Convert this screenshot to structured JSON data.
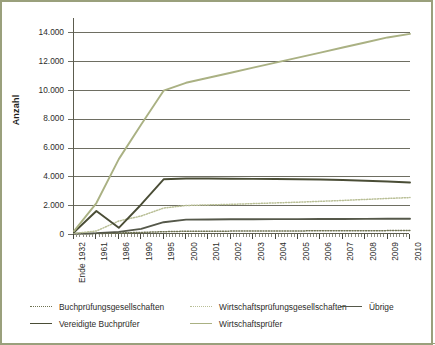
{
  "figure": {
    "border_color": "#9aa07c",
    "background": "#ffffff"
  },
  "axes": {
    "y_title": "Anzahl",
    "y_ticks": [
      "0",
      "2.000",
      "4.000",
      "6.000",
      "8.000",
      "10.000",
      "12.000",
      "14.000"
    ],
    "x_ticks": [
      "Ende 1932",
      "1961",
      "1986",
      "1990",
      "1995",
      "2000",
      "2001",
      "2002",
      "2003",
      "2004",
      "2005",
      "2006",
      "2007",
      "2008",
      "2009",
      "2010"
    ]
  },
  "legend": {
    "row1": [
      {
        "label": "Buchprüfungsgesellschaften",
        "style": "dotted",
        "color": "#6f7352",
        "name": "legend-buchpruefungsgesellschaften"
      },
      {
        "label": "Wirtschaftsprüfungsgesellschaften",
        "style": "dotted",
        "color": "#b9bf96",
        "name": "legend-wirtschaftspruefungsgesellschaften"
      },
      {
        "label": "Übrige",
        "style": "solid",
        "color": "#55584a",
        "name": "legend-uebrige"
      }
    ],
    "row2": [
      {
        "label": "Vereidigte Buchprüfer",
        "style": "solid",
        "color": "#4a4d36",
        "name": "legend-vereidigte-buchpruefer"
      },
      {
        "label": "Wirtschaftsprüfer",
        "style": "solid",
        "color": "#aab183",
        "name": "legend-wirtschaftspruefer"
      }
    ]
  },
  "chart_data": {
    "type": "line",
    "title": "",
    "xlabel": "",
    "ylabel": "Anzahl",
    "ylim": [
      0,
      15000
    ],
    "grid": true,
    "legend_position": "bottom",
    "categories": [
      "Ende 1932",
      "1961",
      "1986",
      "1990",
      "1995",
      "2000",
      "2001",
      "2002",
      "2003",
      "2004",
      "2005",
      "2006",
      "2007",
      "2008",
      "2009",
      "2010"
    ],
    "series": [
      {
        "name": "Wirtschaftsprüfer",
        "color": "#aab183",
        "style": "solid",
        "values": [
          200,
          2150,
          5200,
          7600,
          9950,
          10500,
          10850,
          11200,
          11550,
          11900,
          12250,
          12600,
          12950,
          13300,
          13650,
          13900
        ]
      },
      {
        "name": "Vereidigte Buchprüfer",
        "color": "#4a4d36",
        "style": "solid",
        "values": [
          120,
          1600,
          430,
          2050,
          3800,
          3850,
          3850,
          3840,
          3830,
          3820,
          3800,
          3780,
          3750,
          3700,
          3650,
          3580
        ]
      },
      {
        "name": "Wirtschaftsprüfungsgesellschaften",
        "color": "#b9bf96",
        "style": "dotted",
        "values": [
          40,
          210,
          900,
          1250,
          1800,
          1980,
          2020,
          2060,
          2110,
          2160,
          2210,
          2270,
          2330,
          2400,
          2470,
          2530
        ]
      },
      {
        "name": "Übrige",
        "color": "#55584a",
        "style": "solid",
        "values": [
          20,
          60,
          150,
          360,
          820,
          1000,
          1010,
          1020,
          1025,
          1030,
          1035,
          1040,
          1045,
          1050,
          1055,
          1060
        ]
      },
      {
        "name": "Buchprüfungsgesellschaften",
        "color": "#6f7352",
        "style": "dotted",
        "values": [
          10,
          30,
          70,
          110,
          160,
          190,
          195,
          200,
          205,
          210,
          215,
          220,
          225,
          230,
          235,
          240
        ]
      }
    ]
  }
}
